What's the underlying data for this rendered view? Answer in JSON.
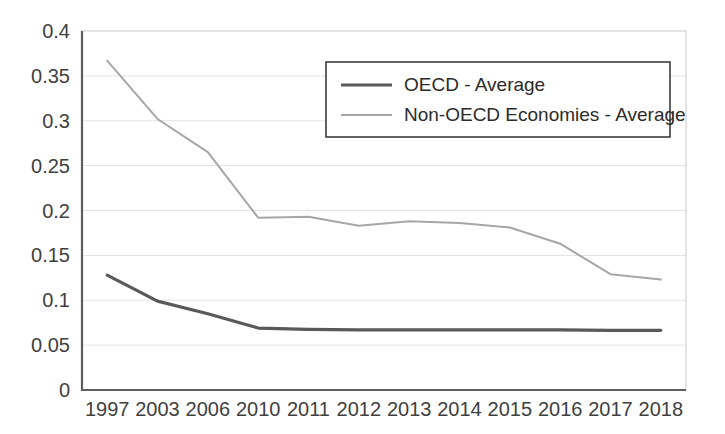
{
  "chart_data": {
    "type": "line",
    "title": "",
    "subtitle": "",
    "xlabel": "",
    "ylabel": "",
    "categories": [
      "1997",
      "2003",
      "2006",
      "2010",
      "2011",
      "2012",
      "2013",
      "2014",
      "2015",
      "2016",
      "2017",
      "2018"
    ],
    "series": [
      {
        "name": "OECD - Average",
        "color": "#595959",
        "line_width": 3.2,
        "values": [
          0.128,
          0.099,
          0.085,
          0.069,
          0.0675,
          0.067,
          0.067,
          0.067,
          0.067,
          0.067,
          0.0665,
          0.0665
        ]
      },
      {
        "name": "Non-OECD Economies - Average",
        "color": "#a6a6a6",
        "line_width": 2.0,
        "values": [
          0.367,
          0.302,
          0.265,
          0.192,
          0.193,
          0.183,
          0.188,
          0.186,
          0.181,
          0.163,
          0.129,
          0.123
        ]
      }
    ],
    "ylim": [
      0,
      0.4
    ],
    "yticks": [
      0,
      0.05,
      0.1,
      0.15,
      0.2,
      0.25,
      0.3,
      0.35,
      0.4
    ],
    "ytick_labels": [
      "0",
      "0.05",
      "0.1",
      "0.15",
      "0.2",
      "0.25",
      "0.3",
      "0.35",
      "0.4"
    ],
    "grid": true,
    "grid_axis": "y",
    "legend_position": "upper-center",
    "legend_entries": [
      "OECD - Average",
      "Non-OECD Economies - Average"
    ],
    "colors": {
      "oecd_line": "#595959",
      "non_oecd_line": "#a6a6a6",
      "gridline": "#e2e2e2",
      "axis": "#5e5e5e",
      "tick_text": "#3f3f3f",
      "legend_border": "#3d3d3d",
      "background": "#ffffff"
    }
  }
}
